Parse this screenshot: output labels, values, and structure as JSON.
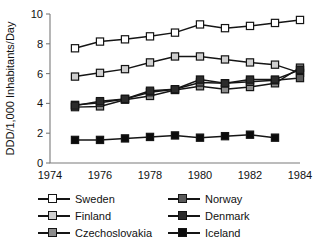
{
  "chart_data": {
    "type": "line",
    "title": "",
    "subtitle": "",
    "xlabel": "",
    "ylabel": "DDD/1,000 Inhabitants/Day",
    "xlim": [
      1974,
      1984
    ],
    "ylim": [
      0,
      10
    ],
    "grid": false,
    "legend_position": "bottom",
    "xticks": [
      1974,
      1976,
      1978,
      1980,
      1982,
      1984
    ],
    "xtick_labels": [
      "1974",
      "1976",
      "1978",
      "1980",
      "1982",
      "1984"
    ],
    "yticks": [
      0,
      2,
      4,
      6,
      8,
      10
    ],
    "ytick_labels": [
      "0",
      "2",
      "4",
      "6",
      "8",
      "10"
    ],
    "marker": "square",
    "line_color": "#151515",
    "series": [
      {
        "name": "Sweden",
        "color": "#ffffff",
        "x": [
          1975,
          1976,
          1977,
          1978,
          1979,
          1980,
          1981,
          1982,
          1983,
          1984
        ],
        "values": [
          7.7,
          8.15,
          8.3,
          8.5,
          8.75,
          9.3,
          9.05,
          9.2,
          9.4,
          9.6
        ]
      },
      {
        "name": "Finland",
        "color": "#cfcfcf",
        "x": [
          1975,
          1976,
          1977,
          1978,
          1979,
          1980,
          1981,
          1982,
          1983,
          1984
        ],
        "values": [
          5.8,
          6.05,
          6.3,
          6.75,
          7.15,
          7.15,
          6.95,
          6.75,
          6.6,
          6.05
        ]
      },
      {
        "name": "Czechoslovakia",
        "color": "#8c8c8c",
        "x": [
          1975,
          1976,
          1977,
          1978,
          1979,
          1980,
          1981,
          1982,
          1983,
          1984
        ],
        "values": [
          3.75,
          3.8,
          4.25,
          4.5,
          4.9,
          5.15,
          4.95,
          5.1,
          5.35,
          6.4
        ]
      },
      {
        "name": "Norway",
        "color": "#5a5a5a",
        "x": [
          1975,
          1976,
          1977,
          1978,
          1979,
          1980,
          1981,
          1982,
          1983,
          1984
        ],
        "values": [
          3.9,
          4.05,
          4.3,
          4.75,
          4.95,
          5.4,
          5.35,
          5.45,
          5.55,
          5.7
        ]
      },
      {
        "name": "Denmark",
        "color": "#2b2b2b",
        "x": [
          1975,
          1976,
          1977,
          1978,
          1979,
          1980,
          1981,
          1982,
          1983,
          1984
        ],
        "values": [
          3.85,
          4.15,
          4.3,
          4.85,
          4.95,
          5.6,
          5.35,
          5.6,
          5.6,
          6.25
        ]
      },
      {
        "name": "Iceland",
        "color": "#0b0b0b",
        "x": [
          1975,
          1976,
          1977,
          1978,
          1979,
          1980,
          1981,
          1982,
          1983
        ],
        "values": [
          1.55,
          1.55,
          1.65,
          1.75,
          1.85,
          1.7,
          1.8,
          1.9,
          1.7
        ]
      }
    ]
  },
  "legend": {
    "items": [
      {
        "label": "Sweden",
        "color": "#ffffff"
      },
      {
        "label": "Norway",
        "color": "#5a5a5a"
      },
      {
        "label": "Finland",
        "color": "#cfcfcf"
      },
      {
        "label": "Denmark",
        "color": "#2b2b2b"
      },
      {
        "label": "Czechoslovakia",
        "color": "#8c8c8c"
      },
      {
        "label": "Iceland",
        "color": "#0b0b0b"
      }
    ]
  }
}
